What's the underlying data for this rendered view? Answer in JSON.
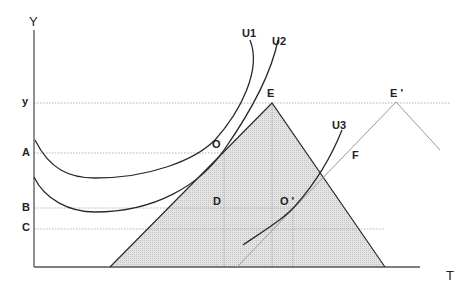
{
  "diagram": {
    "type": "economics-indifference-curve-diagram",
    "axes": {
      "y_label": "Y",
      "x_label": "T"
    },
    "y_ticks": [
      {
        "label": "y",
        "y": 103
      },
      {
        "label": "A",
        "y": 153
      },
      {
        "label": "B",
        "y": 208
      },
      {
        "label": "C",
        "y": 229
      }
    ],
    "curves": [
      {
        "label": "U1"
      },
      {
        "label": "U2"
      },
      {
        "label": "U3"
      }
    ],
    "points": [
      {
        "label": "E"
      },
      {
        "label": "E '"
      },
      {
        "label": "O"
      },
      {
        "label": "O '"
      },
      {
        "label": "D"
      },
      {
        "label": "F"
      }
    ],
    "colors": {
      "line": "#2a2a2a",
      "light_line": "#9a9a9a",
      "fill": "#d9d9d9",
      "dotted": "#9a9a9a"
    }
  }
}
